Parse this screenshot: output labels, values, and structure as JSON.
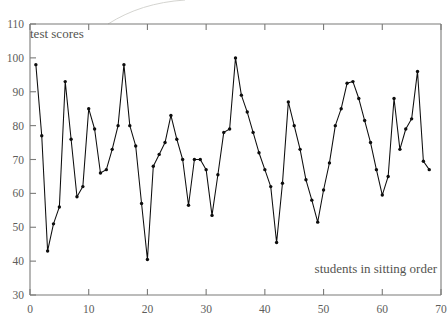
{
  "figure": {
    "background": "#ffffff",
    "ink_color": "#0d0d0d",
    "axis_color": "#7a7a78",
    "label_color": "#5d5d5b",
    "artifact_color": "#cfcfcb"
  },
  "labels": {
    "y_caption": "test scores",
    "x_caption": "students in sitting order"
  },
  "ticks": {
    "x": [
      "0",
      "10",
      "20",
      "30",
      "40",
      "50",
      "60",
      "70"
    ],
    "y": [
      "30",
      "40",
      "50",
      "60",
      "70",
      "80",
      "90",
      "100",
      "110"
    ]
  },
  "chart_data": {
    "type": "line",
    "title": "",
    "xlabel": "students in sitting order",
    "ylabel": "test scores",
    "xlim": [
      0,
      70
    ],
    "ylim": [
      30,
      110
    ],
    "xticks": [
      0,
      10,
      20,
      30,
      40,
      50,
      60,
      70
    ],
    "yticks": [
      30,
      40,
      50,
      60,
      70,
      80,
      90,
      100,
      110
    ],
    "grid": false,
    "legend": null,
    "marker": "filled-circle",
    "series": [
      {
        "name": "test scores",
        "color": "#0d0d0d",
        "x": [
          1,
          2,
          3,
          4,
          5,
          6,
          7,
          8,
          9,
          10,
          11,
          12,
          13,
          14,
          15,
          16,
          17,
          18,
          19,
          20,
          21,
          22,
          23,
          24,
          25,
          26,
          27,
          28,
          29,
          30,
          31,
          32,
          33,
          34,
          35,
          36,
          37,
          38,
          39,
          40,
          41,
          42,
          43,
          44,
          45,
          46,
          47,
          48,
          49,
          50,
          51,
          52,
          53,
          54,
          55,
          56,
          57,
          58,
          59,
          60,
          61,
          62,
          63,
          64,
          65,
          66,
          67,
          68
        ],
        "values": [
          98,
          77,
          43,
          51,
          56,
          93,
          76,
          59,
          62,
          85,
          79,
          66,
          67,
          73,
          80,
          98,
          80,
          74,
          57,
          40.5,
          68,
          71.5,
          75,
          83,
          76,
          70,
          56.5,
          70,
          70,
          67,
          53.5,
          65.5,
          78,
          79,
          100,
          89,
          84,
          78,
          72,
          67,
          62,
          45.5,
          63,
          87,
          80,
          73,
          64,
          58,
          51.5,
          61,
          69,
          80,
          85,
          92.5,
          93,
          88,
          81.5,
          75,
          67,
          59.5,
          65,
          88,
          73,
          79,
          82,
          96,
          69.5,
          67
        ]
      }
    ]
  }
}
